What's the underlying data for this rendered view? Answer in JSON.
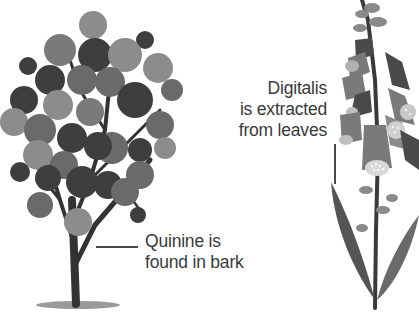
{
  "figure": {
    "palette": {
      "background": "#ffffff",
      "text": "#3a3a3a",
      "leader_line": "#4a4a4a",
      "foliage_dark": "#3e3e3e",
      "foliage_mid": "#6a6a6a",
      "foliage_light": "#8c8c8c",
      "trunk": "#333333",
      "ground_shadow": "#9a9a9a",
      "foxglove_leaf": "#5a5a5a",
      "foxglove_flower": "#7a7a7a",
      "foxglove_spots": "#d8d8d8"
    },
    "plants": [
      {
        "name": "cinchona-tree",
        "label_lines": [
          "Quinine is",
          "found in bark"
        ],
        "points_to": "bark (trunk)"
      },
      {
        "name": "foxglove",
        "label_lines": [
          "Digitalis",
          "is extracted",
          "from leaves"
        ],
        "points_to": "leaves"
      }
    ]
  }
}
